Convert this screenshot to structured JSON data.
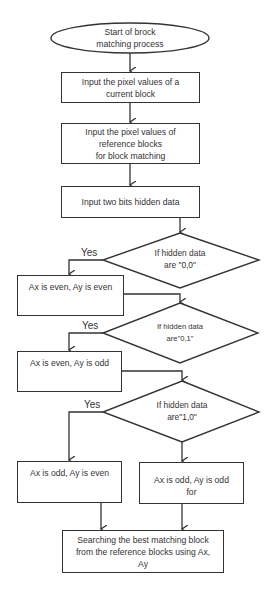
{
  "flowchart": {
    "start": {
      "line1": "Start of brock",
      "line2": "matching process"
    },
    "step_current_block": {
      "line1": "Input the pixel values of a",
      "line2": "current block"
    },
    "step_reference_blocks": {
      "line1": "Input the pixel values of",
      "line2": "reference blocks",
      "line3": "for block matching"
    },
    "step_hidden_data": {
      "label": "Input two bits hidden data"
    },
    "decision_00": {
      "line1": "If hidden data",
      "line2": "are \"0,0\"",
      "yes_label": "Yes"
    },
    "result_00": {
      "label": "Ax is even, Ay is even"
    },
    "decision_01": {
      "line1": "If hidden data",
      "line2": "are\"0,1\"",
      "yes_label": "Yes"
    },
    "result_01": {
      "label": "Ax is even, Ay is odd"
    },
    "decision_10": {
      "line1": "If hidden data",
      "line2": "are\"1,0\"",
      "yes_label": "Yes"
    },
    "result_10": {
      "label": "Ax is odd, Ay is even"
    },
    "result_11": {
      "line1": "Ax is odd, Ay is odd",
      "line2": "for"
    },
    "final_step": {
      "line1": "Searching the best matching block",
      "line2": "from the reference blocks using Ax,",
      "line3": "Ay"
    }
  },
  "colors": {
    "stroke": "#333333",
    "background": "#ffffff",
    "text": "#333333"
  }
}
